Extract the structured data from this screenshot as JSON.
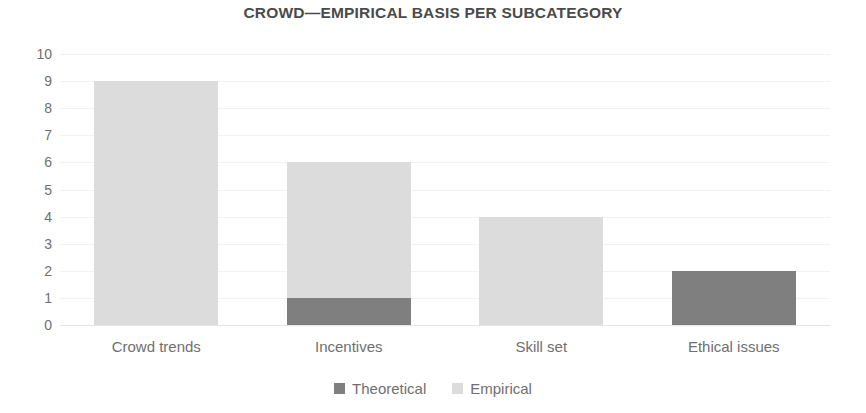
{
  "chart_data": {
    "type": "bar",
    "subtype": "stacked-vertical-bar",
    "title": "CROWD—EMPIRICAL BASIS PER SUBCATEGORY",
    "xlabel": "",
    "ylabel": "",
    "ylim": [
      0,
      10
    ],
    "yticks": [
      0,
      1,
      2,
      3,
      4,
      5,
      6,
      7,
      8,
      9,
      10
    ],
    "ytick_labels": [
      "0",
      "1",
      "2",
      "3",
      "4",
      "5",
      "6",
      "7",
      "8",
      "9",
      "10"
    ],
    "grid": true,
    "grid_axis": "y",
    "legend_position": "bottom-center",
    "legend_orientation": "horizontal",
    "categories": [
      "Crowd trends",
      "Incentives",
      "Skill set",
      "Ethical issues"
    ],
    "series": [
      {
        "name": "Theoretical",
        "color": "#7f7f7f",
        "values": [
          0,
          1,
          0,
          2
        ]
      },
      {
        "name": "Empirical",
        "color": "#dcdcdc",
        "values": [
          9,
          5,
          4,
          0
        ]
      }
    ],
    "totals": [
      9,
      6,
      4,
      2
    ]
  },
  "legend": {
    "items": [
      {
        "label": "Theoretical",
        "swatch": "theoretical"
      },
      {
        "label": "Empirical",
        "swatch": "empirical"
      }
    ]
  },
  "colors": {
    "theoretical": "#7f7f7f",
    "empirical": "#dcdcdc",
    "gridline": "#f2f2f2",
    "baseline": "#e4e4e4",
    "text": "#6f6f6f",
    "title_text": "#4a4a4a",
    "background": "#ffffff"
  }
}
